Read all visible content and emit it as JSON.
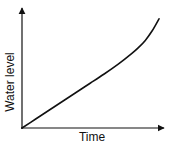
{
  "chart_data": {
    "type": "line",
    "title": "",
    "xlabel": "Time",
    "ylabel": "Water level",
    "grid": false,
    "legend": null,
    "x_ticks": [],
    "y_ticks": [],
    "xlim": [
      0,
      1
    ],
    "ylim": [
      0,
      1
    ],
    "series": [
      {
        "name": "Water level",
        "color": "#111111",
        "x": [
          0.0,
          0.1,
          0.2,
          0.3,
          0.4,
          0.5,
          0.6,
          0.7,
          0.8,
          0.85,
          0.9,
          0.95,
          1.0
        ],
        "y": [
          0.0,
          0.075,
          0.15,
          0.225,
          0.3,
          0.375,
          0.45,
          0.53,
          0.62,
          0.67,
          0.73,
          0.81,
          0.91
        ]
      }
    ]
  },
  "colors": {
    "axis": "#111111",
    "line": "#111111",
    "background": "#ffffff"
  }
}
